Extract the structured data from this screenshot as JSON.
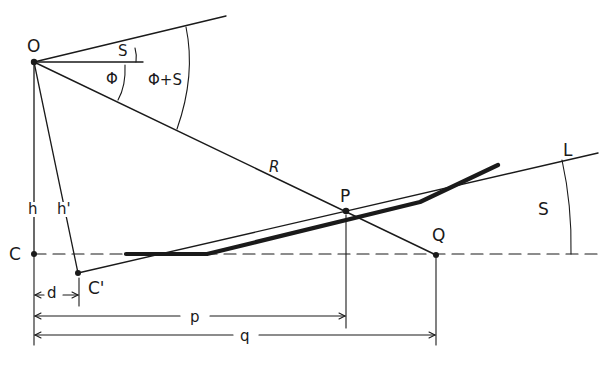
{
  "diagram": {
    "points": {
      "O": {
        "label": "O",
        "x": 34,
        "y": 62
      },
      "C": {
        "label": "C",
        "x": 34,
        "y": 254
      },
      "C_prime": {
        "label": "C'",
        "x": 78,
        "y": 273
      },
      "P": {
        "label": "P",
        "x": 346,
        "y": 211
      },
      "Q": {
        "label": "Q",
        "x": 436,
        "y": 255
      }
    },
    "lines": {
      "L": {
        "label": "L"
      },
      "R": {
        "label": "R"
      },
      "h": {
        "label": "h"
      },
      "h_prime": {
        "label": "h'"
      }
    },
    "angles": {
      "S_small": {
        "label": "S"
      },
      "phi": {
        "label": "Φ"
      },
      "phi_plus_s": {
        "label": "Φ+S"
      },
      "S_right": {
        "label": "S"
      }
    },
    "dimensions": {
      "d": {
        "label": "d"
      },
      "p": {
        "label": "p"
      },
      "q": {
        "label": "q"
      }
    }
  }
}
